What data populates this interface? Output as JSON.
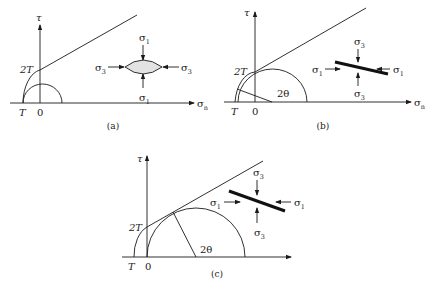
{
  "figure": {
    "panels": [
      {
        "id": "a",
        "caption": "(a)",
        "caption_pos": [
          113,
          129
        ],
        "tau_axis": {
          "x": 40,
          "y_top": 25,
          "y_bottom": 103,
          "label": "τ",
          "label_pos": [
            36,
            21
          ]
        },
        "sigma_axis": {
          "y": 103,
          "x_left": 10,
          "x_right": 194,
          "label": "σ",
          "sub": "n",
          "label_pos": [
            197,
            107
          ]
        },
        "T_label": {
          "text": "T",
          "pos": [
            19,
            116
          ]
        },
        "zero_label": {
          "text": "0",
          "pos": [
            37,
            116
          ]
        },
        "twoT_label": {
          "text": "2T",
          "pos": [
            20,
            73
          ]
        },
        "envelope_arc": "M23,103 A20,34 0 0 1 40,70",
        "envelope_line": [
          [
            40,
            70
          ],
          [
            137,
            15
          ]
        ],
        "circle_arc": "M23,103 A19.5,19 0 0 1 62,103",
        "radius_line": null,
        "angle_label": null,
        "element": {
          "type": "lens",
          "path": "M125,67 Q143,53 162,67 Q143,81 125,67 Z",
          "fill": "#e2e2e2"
        },
        "stress_labels": [
          {
            "text": "σ",
            "sub": "1",
            "pos": [
              139,
              41
            ]
          },
          {
            "text": "σ",
            "sub": "1",
            "pos": [
              139,
              101
            ]
          },
          {
            "text": "σ",
            "sub": "3",
            "pos": [
              95,
              71
            ]
          },
          {
            "text": "σ",
            "sub": "3",
            "pos": [
              181,
              71
            ]
          }
        ],
        "arrows": [
          {
            "from": [
              143,
              45
            ],
            "to": [
              143,
              60
            ]
          },
          {
            "from": [
              143,
              88
            ],
            "to": [
              143,
              74
            ]
          },
          {
            "from": [
              108,
              67
            ],
            "to": [
              124,
              67
            ]
          },
          {
            "from": [
              179,
              67
            ],
            "to": [
              163,
              67
            ]
          }
        ]
      },
      {
        "id": "b",
        "caption": "(b)",
        "caption_pos": [
          323,
          129
        ],
        "tau_axis": {
          "x": 255,
          "y_top": 12,
          "y_bottom": 102,
          "label": "τ",
          "label_pos": [
            244,
            16
          ]
        },
        "sigma_axis": {
          "y": 102,
          "x_left": 224,
          "x_right": 411,
          "label": "σ",
          "sub": "n",
          "label_pos": [
            414,
            106
          ]
        },
        "T_label": {
          "text": "T",
          "pos": [
            231,
            115
          ]
        },
        "zero_label": {
          "text": "0",
          "pos": [
            252,
            115
          ]
        },
        "twoT_label": {
          "text": "2T",
          "pos": [
            234,
            75
          ]
        },
        "envelope_arc": "M235,102 A21,34 0 0 1 255,72",
        "envelope_line": [
          [
            255,
            72
          ],
          [
            366,
            8
          ]
        ],
        "circle_arc": "M238,102 A34.5,33 0 0 1 307,102",
        "radius_line": [
          [
            237,
            89
          ],
          [
            272,
            102
          ]
        ],
        "angle_label": {
          "text": "2θ",
          "pos": [
            277,
            97
          ]
        },
        "element": {
          "type": "bar",
          "from": [
            335,
            62
          ],
          "to": [
            388,
            74
          ]
        },
        "stress_labels": [
          {
            "text": "σ",
            "sub": "3",
            "pos": [
              354,
              45
            ]
          },
          {
            "text": "σ",
            "sub": "3",
            "pos": [
              354,
              97
            ]
          },
          {
            "text": "σ",
            "sub": "1",
            "pos": [
              312,
              73
            ]
          },
          {
            "text": "σ",
            "sub": "1",
            "pos": [
              393,
              73
            ]
          }
        ],
        "arrows": [
          {
            "from": [
              358,
              49
            ],
            "to": [
              358,
              62
            ]
          },
          {
            "from": [
              358,
              86
            ],
            "to": [
              358,
              73
            ]
          },
          {
            "from": [
              325,
              69
            ],
            "to": [
              340,
              69
            ]
          },
          {
            "from": [
              390,
              69
            ],
            "to": [
              377,
              69
            ]
          }
        ]
      },
      {
        "id": "c",
        "caption": "(c)",
        "caption_pos": [
          217,
          277
        ],
        "tau_axis": {
          "x": 147,
          "y_top": 156,
          "y_bottom": 257,
          "label": "τ",
          "label_pos": [
            137,
            162
          ]
        },
        "sigma_axis": {
          "y": 257,
          "x_left": 122,
          "x_right": 291,
          "label": "",
          "sub": "",
          "label_pos": [
            0,
            0
          ]
        },
        "T_label": {
          "text": "T",
          "pos": [
            128,
            270
          ]
        },
        "zero_label": {
          "text": "0",
          "pos": [
            145,
            270
          ]
        },
        "twoT_label": {
          "text": "2T",
          "pos": [
            129,
            231
          ]
        },
        "envelope_arc": "M134,257 A20,31 0 0 1 147,227",
        "envelope_line": [
          [
            147,
            227
          ],
          [
            263,
            161
          ]
        ],
        "circle_arc": "M147,257 A49,49 0 0 1 245,257",
        "radius_line": [
          [
            173,
            212
          ],
          [
            196,
            257
          ]
        ],
        "angle_label": {
          "text": "2θ",
          "pos": [
            200,
            253
          ]
        },
        "element": {
          "type": "bar",
          "from": [
            229,
            191
          ],
          "to": [
            285,
            211
          ]
        },
        "stress_labels": [
          {
            "text": "σ",
            "sub": "3",
            "pos": [
              253,
              176
            ]
          },
          {
            "text": "σ",
            "sub": "3",
            "pos": [
              254,
              236
            ]
          },
          {
            "text": "σ",
            "sub": "1",
            "pos": [
              210,
              206
            ]
          },
          {
            "text": "σ",
            "sub": "1",
            "pos": [
              294,
              206
            ]
          }
        ],
        "arrows": [
          {
            "from": [
              257,
              180
            ],
            "to": [
              257,
              195
            ]
          },
          {
            "from": [
              257,
              223
            ],
            "to": [
              257,
              208
            ]
          },
          {
            "from": [
              224,
              202
            ],
            "to": [
              240,
              202
            ]
          },
          {
            "from": [
              291,
              202
            ],
            "to": [
              276,
              202
            ]
          }
        ]
      }
    ]
  }
}
